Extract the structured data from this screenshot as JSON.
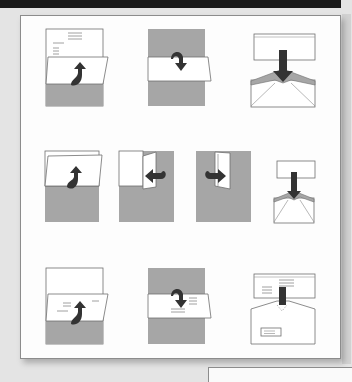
{
  "colors": {
    "paper": "#ffffff",
    "paper_shaded": "#a6a6a6",
    "arrow": "#333333",
    "outline": "#6e6e6e",
    "envelope_flap": "#a6a6a6",
    "background": "#e4e4e4",
    "top_band": "#1a1a1a"
  },
  "rows": [
    {
      "name": "tri-fold-letter",
      "steps": [
        {
          "name": "fold-bottom-up",
          "icon": "fold-up-arrow-icon"
        },
        {
          "name": "fold-top-down",
          "icon": "fold-down-arrow-icon"
        },
        {
          "name": "insert-into-envelope",
          "icon": "insert-envelope-icon"
        }
      ]
    },
    {
      "name": "quarter-fold-letter",
      "steps": [
        {
          "name": "fold-bottom-up",
          "icon": "fold-up-arrow-icon"
        },
        {
          "name": "fold-right-to-left",
          "icon": "fold-left-arrow-icon"
        },
        {
          "name": "fold-left-to-right",
          "icon": "fold-right-arrow-icon"
        },
        {
          "name": "insert-into-envelope",
          "icon": "insert-envelope-icon"
        }
      ]
    },
    {
      "name": "window-envelope-letter",
      "steps": [
        {
          "name": "fold-bottom-up",
          "icon": "fold-up-arrow-icon"
        },
        {
          "name": "fold-top-down",
          "icon": "fold-down-arrow-icon"
        },
        {
          "name": "insert-into-window-envelope",
          "icon": "window-envelope-icon"
        }
      ]
    }
  ]
}
